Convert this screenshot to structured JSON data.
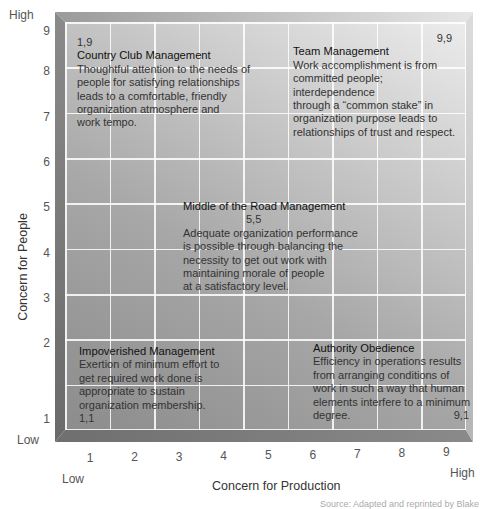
{
  "chart_data": {
    "type": "heatmap",
    "xlabel": "Concern for Production",
    "ylabel": "Concern for People",
    "xlim": [
      1,
      9
    ],
    "ylim": [
      1,
      9
    ],
    "x_ticks": [
      "1",
      "2",
      "3",
      "4",
      "5",
      "6",
      "7",
      "8",
      "9"
    ],
    "y_ticks": [
      "1",
      "2",
      "3",
      "4",
      "5",
      "6",
      "7",
      "8",
      "9"
    ],
    "x_low_label": "Low",
    "x_high_label": "High",
    "y_low_label": "Low",
    "y_high_label": "High",
    "grid": true,
    "annotations": [
      {
        "id": "country-club",
        "coord": "1,9",
        "x": 1,
        "y": 9,
        "title": "Country Club Management",
        "lines": [
          "Thoughtful attention to the needs of",
          "people for satisfying relationships",
          "leads to a comfortable, friendly",
          "organization atmosphere and",
          "work tempo."
        ]
      },
      {
        "id": "team",
        "coord": "9,9",
        "x": 9,
        "y": 9,
        "title": "Team Management",
        "lines": [
          "Work accomplishment is from",
          "committed people; interdependence",
          "through a “common stake” in",
          "organization purpose leads to",
          "relationships of trust and respect."
        ]
      },
      {
        "id": "middle-road",
        "coord": "5,5",
        "x": 5,
        "y": 5,
        "title": "Middle of the Road Management",
        "lines": [
          "Adequate organization performance",
          "is possible through balancing the",
          "necessity to get out work with",
          "maintaining morale of people",
          "at a satisfactory level."
        ]
      },
      {
        "id": "impoverished",
        "coord": "1,1",
        "x": 1,
        "y": 1,
        "title": "Impoverished Management",
        "lines": [
          "Exertion of minimum effort to",
          "get required work done is",
          "appropriate to sustain",
          "organization membership."
        ]
      },
      {
        "id": "authority-obedience",
        "coord": "9,1",
        "x": 9,
        "y": 1,
        "title": "Authority Obedience",
        "lines": [
          "Efficiency in operations results",
          "from arranging conditions of",
          "work in such a way that human",
          "elements interfere to a minimum",
          "degree."
        ]
      }
    ]
  },
  "credit": "Source: Adapted and reprinted by Blake"
}
